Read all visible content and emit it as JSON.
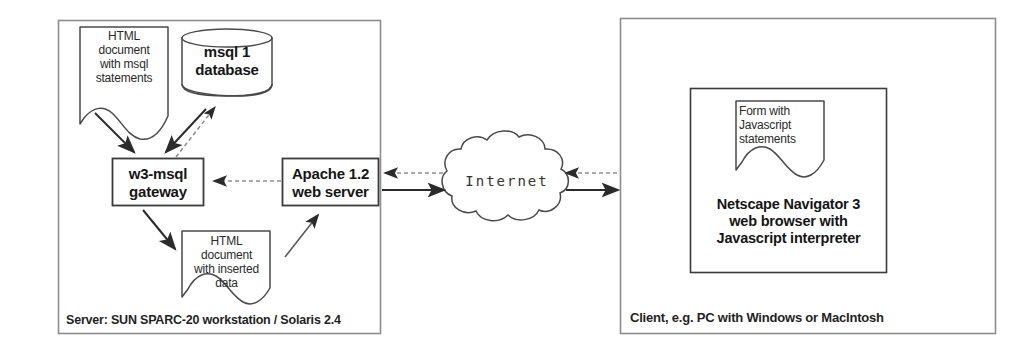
{
  "diagram": {
    "server_panel": {
      "caption": "Server: SUN SPARC-20 workstation / Solaris 2.4",
      "html_source_doc": "HTML\ndocument\nwith  msql\nstatements",
      "database": "msql 1\ndatabase",
      "gateway": "w3-msql\ngateway",
      "web_server": "Apache 1.2\nweb server",
      "html_result_doc": "HTML\ndocument\nwith inserted\ndata"
    },
    "network": {
      "cloud_label": "Internet"
    },
    "client_panel": {
      "caption": "Client, e.g. PC with Windows or MacIntosh",
      "form_doc": "Form with\nJavascript\nstatements",
      "browser": "Netscape Navigator 3\nweb browser with\nJavascript interpreter"
    }
  },
  "colors": {
    "stroke": "#3a3a3a",
    "text": "#1a1a1a",
    "panel_border": "#8a8a8a",
    "background": "#ffffff"
  }
}
